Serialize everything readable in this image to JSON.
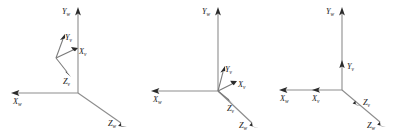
{
  "figure": {
    "title": "",
    "background_color": "#ffffff",
    "axis_color": "#8d8d8d",
    "arrow_color": "#2b2b2b",
    "label_color": "#1a1a1a"
  },
  "panels": [
    {
      "name": "panel-1",
      "world_frame": {
        "x": {
          "letter": "X",
          "sub": "w"
        },
        "y": {
          "letter": "Y",
          "sub": "w"
        },
        "z": {
          "letter": "Z",
          "sub": "w"
        }
      },
      "vehicle_frame": {
        "x": {
          "letter": "X",
          "sub": "v"
        },
        "y": {
          "letter": "Y",
          "sub": "v"
        },
        "z": {
          "letter": "Z",
          "sub": "v"
        }
      }
    },
    {
      "name": "panel-2",
      "world_frame": {
        "x": {
          "letter": "X",
          "sub": "w"
        },
        "y": {
          "letter": "Y",
          "sub": "w"
        },
        "z": {
          "letter": "Z",
          "sub": "w"
        }
      },
      "vehicle_frame": {
        "x": {
          "letter": "X",
          "sub": "v"
        },
        "y": {
          "letter": "Y",
          "sub": "v"
        },
        "z": {
          "letter": "Z",
          "sub": "v"
        }
      }
    },
    {
      "name": "panel-3",
      "world_frame": {
        "x": {
          "letter": "X",
          "sub": "w"
        },
        "y": {
          "letter": "Y",
          "sub": "w"
        },
        "z": {
          "letter": "Z",
          "sub": "w"
        }
      },
      "vehicle_frame": {
        "x": {
          "letter": "X",
          "sub": "v"
        },
        "y": {
          "letter": "Y",
          "sub": "v"
        },
        "z": {
          "letter": "Z",
          "sub": "v"
        }
      }
    }
  ]
}
